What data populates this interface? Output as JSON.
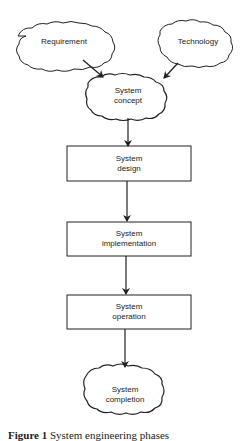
{
  "diagram": {
    "nodes": [
      {
        "id": "requirement",
        "shape": "cloud",
        "line1": "Requirement",
        "line2": ""
      },
      {
        "id": "technology",
        "shape": "cloud",
        "line1": "Technology",
        "line2": ""
      },
      {
        "id": "system_concept",
        "shape": "cloud",
        "line1": "System",
        "line2": "concept"
      },
      {
        "id": "system_design",
        "shape": "box",
        "line1": "System",
        "line2": "design"
      },
      {
        "id": "system_implementation",
        "shape": "box",
        "line1": "System",
        "line2": "implementation"
      },
      {
        "id": "system_operation",
        "shape": "box",
        "line1": "System",
        "line2": "operation"
      },
      {
        "id": "system_completion",
        "shape": "cloud",
        "line1": "System",
        "line2": "completion"
      }
    ],
    "edges": [
      {
        "from": "requirement",
        "to": "system_concept"
      },
      {
        "from": "technology",
        "to": "system_concept"
      },
      {
        "from": "system_concept",
        "to": "system_design"
      },
      {
        "from": "system_design",
        "to": "system_implementation"
      },
      {
        "from": "system_implementation",
        "to": "system_operation"
      },
      {
        "from": "system_operation",
        "to": "system_completion"
      }
    ],
    "caption": {
      "label": "Figure 1",
      "text": "System engineering phases"
    }
  }
}
